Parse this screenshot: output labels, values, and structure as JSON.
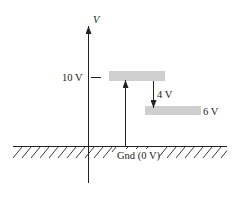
{
  "diagram": {
    "type": "voltage-level-diagram",
    "axis": {
      "label": "V"
    },
    "levels": [
      {
        "id": "high",
        "label": "10 V",
        "value": 10
      },
      {
        "id": "low",
        "label": "6 V",
        "value": 6
      }
    ],
    "drop": {
      "label": "4 V",
      "value": 4
    },
    "ground": {
      "label": "Gnd (0 V)",
      "value": 0
    },
    "colors": {
      "line": "#222222",
      "bar": "#cfcfcf",
      "background": "#ffffff"
    }
  }
}
